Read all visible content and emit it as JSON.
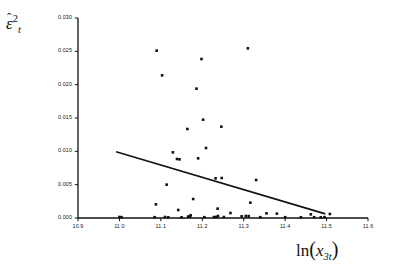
{
  "figure": {
    "background_color": "#ffffff",
    "ink_color": "#111111",
    "width": 394,
    "height": 269
  },
  "axes": {
    "y_title_parts": {
      "symbol": "ε",
      "hat": "ˆ",
      "superscript": "2",
      "subscript": "t"
    },
    "x_title_parts": {
      "function": "ln",
      "open_paren": "(",
      "variable": "x",
      "subscript": "3t",
      "close_paren": ")"
    },
    "y_tick_labels": [
      "0.030",
      "0.025",
      "0.020",
      "0.015",
      "0.010",
      "0.005",
      "0.000"
    ],
    "x_tick_labels": [
      "10.9",
      "11.0",
      "11.1",
      "11.2",
      "11.3",
      "11.4",
      "11.5",
      "11.6"
    ]
  },
  "chart_data": {
    "type": "scatter",
    "title": "",
    "xlabel": "ln(x_3t)",
    "ylabel": "epsilon-hat squared sub t",
    "xlim": [
      10.9,
      11.6
    ],
    "ylim": [
      0.0,
      0.03
    ],
    "xticks": [
      10.9,
      11.0,
      11.1,
      11.2,
      11.3,
      11.4,
      11.5,
      11.6
    ],
    "yticks": [
      0.0,
      0.005,
      0.01,
      0.015,
      0.02,
      0.025,
      0.03
    ],
    "grid": false,
    "legend": null,
    "marker": {
      "shape": "square",
      "color": "#111111",
      "size_px": 2.6
    },
    "points": [
      {
        "x": 11.09,
        "y": 0.0251
      },
      {
        "x": 11.103,
        "y": 0.0214
      },
      {
        "x": 11.198,
        "y": 0.02385
      },
      {
        "x": 11.31,
        "y": 0.02545
      },
      {
        "x": 11.186,
        "y": 0.0194
      },
      {
        "x": 11.202,
        "y": 0.01475
      },
      {
        "x": 11.246,
        "y": 0.0137
      },
      {
        "x": 11.164,
        "y": 0.01335
      },
      {
        "x": 11.209,
        "y": 0.0105
      },
      {
        "x": 11.129,
        "y": 0.00985
      },
      {
        "x": 11.139,
        "y": 0.00885
      },
      {
        "x": 11.145,
        "y": 0.0088
      },
      {
        "x": 11.19,
        "y": 0.00895
      },
      {
        "x": 11.232,
        "y": 0.00595
      },
      {
        "x": 11.247,
        "y": 0.006
      },
      {
        "x": 11.33,
        "y": 0.0057
      },
      {
        "x": 11.114,
        "y": 0.005
      },
      {
        "x": 11.316,
        "y": 0.0023
      },
      {
        "x": 11.178,
        "y": 0.00285
      },
      {
        "x": 11.088,
        "y": 0.00205
      },
      {
        "x": 11.237,
        "y": 0.0014
      },
      {
        "x": 11.142,
        "y": 0.0012
      },
      {
        "x": 11.268,
        "y": 0.00075
      },
      {
        "x": 11.355,
        "y": 0.0007
      },
      {
        "x": 11.38,
        "y": 0.00065
      },
      {
        "x": 11.462,
        "y": 0.00055
      },
      {
        "x": 11.508,
        "y": 0.0006
      },
      {
        "x": 11.0,
        "y": 0.00015
      },
      {
        "x": 11.005,
        "y": 0.00012
      },
      {
        "x": 11.085,
        "y": 0.00012
      },
      {
        "x": 11.11,
        "y": 0.00015
      },
      {
        "x": 11.118,
        "y": 0.0001
      },
      {
        "x": 11.15,
        "y": 0.0001
      },
      {
        "x": 11.166,
        "y": 0.00022
      },
      {
        "x": 11.17,
        "y": 0.0002
      },
      {
        "x": 11.172,
        "y": 0.0004
      },
      {
        "x": 11.205,
        "y": 0.00012
      },
      {
        "x": 11.228,
        "y": 0.00014
      },
      {
        "x": 11.234,
        "y": 0.00016
      },
      {
        "x": 11.238,
        "y": 0.0003
      },
      {
        "x": 11.252,
        "y": 0.00014
      },
      {
        "x": 11.295,
        "y": 0.00025
      },
      {
        "x": 11.305,
        "y": 0.0003
      },
      {
        "x": 11.312,
        "y": 0.00028
      },
      {
        "x": 11.34,
        "y": 0.00012
      },
      {
        "x": 11.4,
        "y": 0.00012
      },
      {
        "x": 11.438,
        "y": 0.0001
      },
      {
        "x": 11.47,
        "y": 0.00012
      },
      {
        "x": 11.486,
        "y": 0.0001
      },
      {
        "x": 11.495,
        "y": 0.00012
      }
    ],
    "trend_line": {
      "type": "linear-fit",
      "x_start": 10.992,
      "y_start": 0.00995,
      "x_end": 11.497,
      "y_end": 0.00062,
      "color": "#111111",
      "width_px": 1.6
    }
  }
}
